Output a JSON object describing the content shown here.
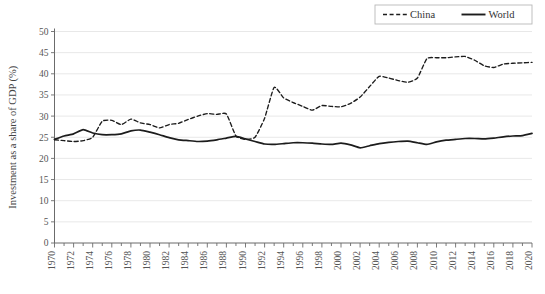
{
  "chart_data": {
    "type": "line",
    "title": "",
    "xlabel": "",
    "ylabel": "Investment as a share of GDP (%)",
    "ylim": [
      0,
      50
    ],
    "ytick_step": 5,
    "yticks": [
      "0",
      "5",
      "10",
      "15",
      "20",
      "25",
      "30",
      "35",
      "40",
      "45",
      "50"
    ],
    "xlim": [
      1970,
      2020
    ],
    "xtick_step": 2,
    "xticks": [
      "1970",
      "1972",
      "1974",
      "1976",
      "1978",
      "1980",
      "1982",
      "1984",
      "1986",
      "1988",
      "1990",
      "1992",
      "1994",
      "1996",
      "1998",
      "2000",
      "2002",
      "2004",
      "2006",
      "2008",
      "2010",
      "2012",
      "2014",
      "2016",
      "2018",
      "2020"
    ],
    "grid": "horizontal",
    "legend_position": "top-right",
    "x": [
      1970,
      1971,
      1972,
      1973,
      1974,
      1975,
      1976,
      1977,
      1978,
      1979,
      1980,
      1981,
      1982,
      1983,
      1984,
      1985,
      1986,
      1987,
      1988,
      1989,
      1990,
      1991,
      1992,
      1993,
      1994,
      1995,
      1996,
      1997,
      1998,
      1999,
      2000,
      2001,
      2002,
      2003,
      2004,
      2005,
      2006,
      2007,
      2008,
      2009,
      2010,
      2011,
      2012,
      2013,
      2014,
      2015,
      2016,
      2017,
      2018,
      2019,
      2020
    ],
    "series": [
      {
        "name": "China",
        "style": "dashed",
        "color": "#1c1c1c",
        "values": [
          24.4,
          24.2,
          24.0,
          24.2,
          25.0,
          28.8,
          29.0,
          28.0,
          29.3,
          28.4,
          28.0,
          27.2,
          28.0,
          28.3,
          29.2,
          30.0,
          30.6,
          30.4,
          30.5,
          25.3,
          24.5,
          25.0,
          29.5,
          36.8,
          34.3,
          33.2,
          32.3,
          31.4,
          32.5,
          32.3,
          32.2,
          33.0,
          34.5,
          37.0,
          39.4,
          39.0,
          38.4,
          38.0,
          39.0,
          43.6,
          43.8,
          43.8,
          44.0,
          44.1,
          43.2,
          41.9,
          41.5,
          42.3,
          42.5,
          42.6,
          42.7
        ]
      },
      {
        "name": "World",
        "style": "solid",
        "color": "#1c1c1c",
        "values": [
          24.5,
          25.3,
          25.8,
          26.8,
          26.0,
          25.6,
          25.6,
          25.8,
          26.5,
          26.7,
          26.2,
          25.6,
          24.9,
          24.4,
          24.2,
          24.0,
          24.1,
          24.4,
          24.8,
          25.2,
          24.6,
          24.0,
          23.4,
          23.3,
          23.5,
          23.7,
          23.7,
          23.6,
          23.4,
          23.3,
          23.6,
          23.2,
          22.5,
          23.0,
          23.5,
          23.8,
          24.0,
          24.1,
          23.7,
          23.3,
          23.9,
          24.3,
          24.5,
          24.7,
          24.7,
          24.6,
          24.8,
          25.1,
          25.3,
          25.4,
          25.9
        ]
      }
    ]
  },
  "legend": {
    "items": [
      {
        "label": "China",
        "style": "dashed"
      },
      {
        "label": "World",
        "style": "solid"
      }
    ]
  }
}
